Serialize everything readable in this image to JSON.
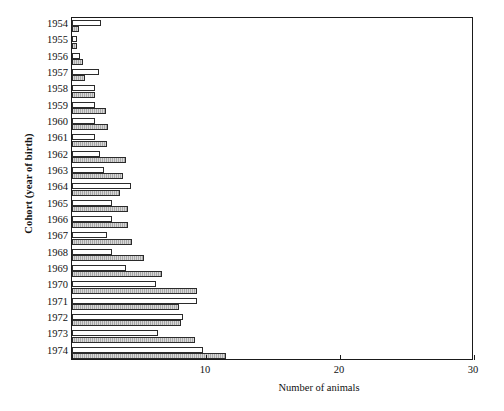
{
  "chart_data": {
    "type": "bar",
    "orientation": "horizontal",
    "title": "",
    "xlabel": "Number of animals",
    "ylabel": "Cohort (year of birth)",
    "xlim": [
      0,
      30
    ],
    "xticks": [
      0,
      10,
      20,
      30
    ],
    "xticklabels": [
      "",
      "10",
      "20",
      "30"
    ],
    "grid": false,
    "legend": "none",
    "categories": [
      "1954",
      "1955",
      "1956",
      "1957",
      "1958",
      "1959",
      "1960",
      "1961",
      "1962",
      "1963",
      "1964",
      "1965",
      "1966",
      "1967",
      "1968",
      "1969",
      "1970",
      "1971",
      "1972",
      "1973",
      "1974"
    ],
    "series": [
      {
        "name": "white-bar",
        "style": "open",
        "color": "#ffffff",
        "values": [
          2.2,
          0.4,
          0.6,
          2.0,
          1.7,
          1.7,
          1.7,
          1.7,
          2.1,
          2.4,
          4.4,
          3.0,
          3.0,
          2.6,
          3.0,
          4.0,
          6.3,
          9.3,
          8.3,
          6.4,
          9.8
        ]
      },
      {
        "name": "gray-bar",
        "style": "filled-hatched",
        "color": "#a8a8a8",
        "values": [
          0.5,
          0.4,
          0.8,
          1.0,
          1.7,
          2.5,
          2.7,
          2.6,
          4.0,
          3.8,
          3.6,
          4.2,
          4.2,
          4.5,
          5.4,
          6.7,
          9.3,
          8.0,
          8.1,
          9.2,
          11.5
        ]
      }
    ],
    "series_cumulative_note": "bars are drawn from the axis origin; white bar and gray bar are overlaid per cohort",
    "white_bar_totals": [
      2.2,
      0.4,
      0.6,
      2.0,
      1.7,
      1.7,
      1.7,
      1.7,
      2.1,
      2.4,
      4.4,
      3.0,
      3.0,
      2.6,
      3.0,
      4.0,
      6.3,
      9.3,
      8.3,
      6.4,
      9.8
    ],
    "gray_bar_totals": [
      0.5,
      0.4,
      0.8,
      1.0,
      1.7,
      2.5,
      2.7,
      2.6,
      4.0,
      3.8,
      3.6,
      4.2,
      4.2,
      4.5,
      5.4,
      6.7,
      9.3,
      8.0,
      8.1,
      9.2,
      11.5
    ],
    "plotted_values": {
      "1954": {
        "white": 2.2,
        "gray": 0.5
      },
      "1955": {
        "white": 0.4,
        "gray": 0.4
      },
      "1956": {
        "white": 0.6,
        "gray": 0.8
      },
      "1957": {
        "white": 2.0,
        "gray": 1.0
      },
      "1958": {
        "white": 1.7,
        "gray": 1.7
      },
      "1959": {
        "white": 1.7,
        "gray": 2.5
      },
      "1960": {
        "white": 1.7,
        "gray": 2.7
      },
      "1961": {
        "white": 1.7,
        "gray": 2.6
      },
      "1962": {
        "white": 2.1,
        "gray": 4.0
      },
      "1963": {
        "white": 2.4,
        "gray": 3.8
      },
      "1964": {
        "white": 4.4,
        "gray": 3.6
      },
      "1965": {
        "white": 3.0,
        "gray": 4.2
      },
      "1966": {
        "white": 3.0,
        "gray": 4.2
      },
      "1967": {
        "white": 2.6,
        "gray": 4.5
      },
      "1968": {
        "white": 3.0,
        "gray": 5.4
      },
      "1969": {
        "white": 4.0,
        "gray": 6.7
      },
      "1970": {
        "white": 6.3,
        "gray": 9.3
      },
      "1971": {
        "white": 9.3,
        "gray": 8.0
      },
      "1972": {
        "white": 8.3,
        "gray": 8.1
      },
      "1973": {
        "white": 6.4,
        "gray": 9.2
      },
      "1974": {
        "white": 9.8,
        "gray": 11.5
      }
    }
  }
}
